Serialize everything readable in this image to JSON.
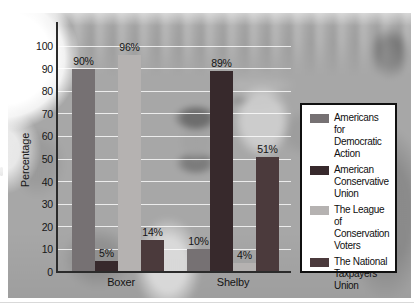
{
  "figure": {
    "background_description": "black-and-white crowd photograph behind the chart",
    "photo_base_color": "#a7a7a7",
    "gridline_color": "#ffffff",
    "axis_color": "#2b2b2b",
    "text_color": "#141414",
    "legend_border_color": "#101010"
  },
  "chart_data": {
    "type": "bar",
    "title": "",
    "categories": [
      "Boxer",
      "Shelby"
    ],
    "series": [
      {
        "name": "Americans for Democratic Action",
        "values": [
          90,
          10
        ],
        "color": "#767173"
      },
      {
        "name": "American Conservative Union",
        "values": [
          5,
          89
        ],
        "color": "#37292c"
      },
      {
        "name": "The League of Conservation Voters",
        "values": [
          96,
          4
        ],
        "color": "#b5b2b1"
      },
      {
        "name": "The National Taxpayers Union",
        "values": [
          14,
          51
        ],
        "color": "#4b3a3c"
      }
    ],
    "data_labels": [
      [
        "90%",
        "10%"
      ],
      [
        "5%",
        "89%"
      ],
      [
        "96%",
        "4%"
      ],
      [
        "14%",
        "51%"
      ]
    ],
    "xlabel": "",
    "ylabel": "Percentage",
    "ylim": [
      0,
      100
    ],
    "yticks": [
      0,
      10,
      20,
      30,
      40,
      50,
      60,
      70,
      80,
      90,
      100
    ],
    "grid": "horizontal white gridlines on",
    "legend_position": "right",
    "legend": [
      "Americans for Democratic Action",
      "American Conservative Union",
      "The League of Conservation Voters",
      "The National Taxpayers Union"
    ]
  }
}
